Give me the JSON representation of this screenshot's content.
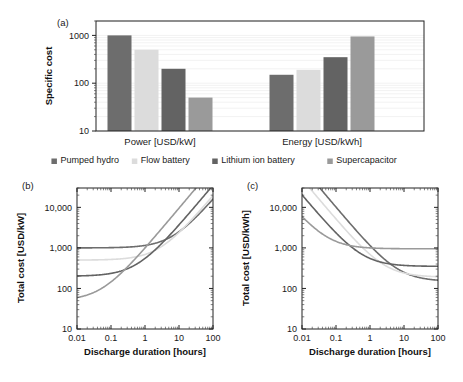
{
  "figure": {
    "panels": [
      {
        "tag": "(a)"
      },
      {
        "tag": "(b)"
      },
      {
        "tag": "(c)"
      }
    ]
  },
  "legend": {
    "position": "below-panel-a",
    "items": [
      {
        "label": "Pumped hydro",
        "color": "#6d6d6d"
      },
      {
        "label": "Flow battery",
        "color": "#dcdcdc"
      },
      {
        "label": "Lithium ion battery",
        "color": "#636363"
      },
      {
        "label": "Supercapacitor",
        "color": "#9a9a9a"
      }
    ]
  },
  "chart_data": [
    {
      "panel": "(a)",
      "type": "bar",
      "title": "",
      "xlabel": "",
      "ylabel": "Specific cost",
      "yscale": "log",
      "ylim": [
        10,
        2000
      ],
      "yticks": [
        10,
        100,
        1000
      ],
      "ytick_labels": [
        "10",
        "100",
        "1000"
      ],
      "grid": true,
      "categories": [
        "Power [USD/kW]",
        "Energy [USD/kWh]"
      ],
      "series": [
        {
          "name": "Pumped hydro",
          "color": "#6d6d6d",
          "values": [
            1000,
            150
          ]
        },
        {
          "name": "Flow battery",
          "color": "#dcdcdc",
          "values": [
            500,
            190
          ]
        },
        {
          "name": "Lithium ion battery",
          "color": "#636363",
          "values": [
            200,
            350
          ]
        },
        {
          "name": "Supercapacitor",
          "color": "#9a9a9a",
          "values": [
            50,
            950
          ]
        }
      ]
    },
    {
      "panel": "(b)",
      "type": "line",
      "title": "",
      "xlabel": "Discharge duration [hours]",
      "ylabel": "Total cost [USD/kW]",
      "xscale": "log",
      "yscale": "log",
      "xlim": [
        0.01,
        100
      ],
      "ylim": [
        10,
        30000
      ],
      "xticks": [
        0.01,
        0.1,
        1,
        10,
        100
      ],
      "xtick_labels": [
        "0.01",
        "0.1",
        "1",
        "10",
        "100"
      ],
      "yticks": [
        10,
        100,
        1000,
        10000
      ],
      "ytick_labels": [
        "10",
        "100",
        "1,000",
        "10,000"
      ],
      "grid": false,
      "note": "Total cost per kW = power cost + energy cost x discharge duration",
      "series": [
        {
          "name": "Pumped hydro",
          "color": "#6d6d6d",
          "power_cost": 1000,
          "energy_cost": 150,
          "x": [
            0.01,
            0.1,
            1,
            10,
            100
          ],
          "values": [
            1001,
            1015,
            1150,
            2500,
            16000
          ]
        },
        {
          "name": "Flow battery",
          "color": "#dcdcdc",
          "power_cost": 500,
          "energy_cost": 190,
          "x": [
            0.01,
            0.1,
            1,
            10,
            100
          ],
          "values": [
            502,
            519,
            690,
            2400,
            19500
          ]
        },
        {
          "name": "Lithium ion battery",
          "color": "#636363",
          "power_cost": 200,
          "energy_cost": 350,
          "x": [
            0.01,
            0.1,
            1,
            10,
            100
          ],
          "values": [
            203,
            235,
            550,
            3700,
            35200
          ]
        },
        {
          "name": "Supercapacitor",
          "color": "#9a9a9a",
          "power_cost": 50,
          "energy_cost": 950,
          "x": [
            0.01,
            0.1,
            1,
            10,
            100
          ],
          "values": [
            59,
            145,
            1000,
            9550,
            95050
          ]
        }
      ]
    },
    {
      "panel": "(c)",
      "type": "line",
      "title": "",
      "xlabel": "Discharge duration [hours]",
      "ylabel": "Total cost [USD/kWh]",
      "xscale": "log",
      "yscale": "log",
      "xlim": [
        0.01,
        100
      ],
      "ylim": [
        10,
        30000
      ],
      "xticks": [
        0.01,
        0.1,
        1,
        10,
        100
      ],
      "xtick_labels": [
        "0.01",
        "0.1",
        "1",
        "10",
        "100"
      ],
      "yticks": [
        10,
        100,
        1000,
        10000
      ],
      "ytick_labels": [
        "10",
        "100",
        "1,000",
        "10,000"
      ],
      "grid": false,
      "note": "Total cost per kWh = power cost / discharge duration + energy cost",
      "series": [
        {
          "name": "Pumped hydro",
          "color": "#6d6d6d",
          "power_cost": 1000,
          "energy_cost": 150,
          "x": [
            0.01,
            0.1,
            1,
            10,
            100
          ],
          "values": [
            100150,
            10150,
            1150,
            250,
            160
          ]
        },
        {
          "name": "Flow battery",
          "color": "#dcdcdc",
          "power_cost": 500,
          "energy_cost": 190,
          "x": [
            0.01,
            0.1,
            1,
            10,
            100
          ],
          "values": [
            50190,
            5190,
            690,
            240,
            195
          ]
        },
        {
          "name": "Lithium ion battery",
          "color": "#636363",
          "power_cost": 200,
          "energy_cost": 350,
          "x": [
            0.01,
            0.1,
            1,
            10,
            100
          ],
          "values": [
            20350,
            2350,
            550,
            370,
            352
          ]
        },
        {
          "name": "Supercapacitor",
          "color": "#9a9a9a",
          "power_cost": 50,
          "energy_cost": 950,
          "x": [
            0.01,
            0.1,
            1,
            10,
            100
          ],
          "values": [
            5950,
            1450,
            1000,
            955,
            950
          ]
        }
      ]
    }
  ]
}
